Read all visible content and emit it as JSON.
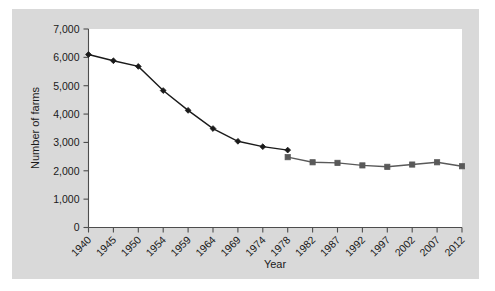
{
  "chart_data": {
    "type": "line",
    "title": "",
    "xlabel": "Year",
    "ylabel": "Number of farms",
    "x": [
      "1940",
      "1945",
      "1950",
      "1954",
      "1959",
      "1964",
      "1969",
      "1974",
      "1978",
      "1982",
      "1987",
      "1992",
      "1997",
      "2002",
      "2007",
      "2012"
    ],
    "xtick_labels": [
      "1940",
      "1945",
      "1950",
      "1954",
      "1959",
      "1964",
      "1969",
      "1974",
      "1978",
      "1982",
      "1987",
      "1992",
      "1997",
      "2002",
      "2007",
      "2012"
    ],
    "ytick_labels": [
      "0",
      "1,000",
      "2,000",
      "3,000",
      "4,000",
      "5,000",
      "6,000",
      "7,000"
    ],
    "ytick_values": [
      0,
      1000,
      2000,
      3000,
      4000,
      5000,
      6000,
      7000
    ],
    "ylim": [
      0,
      7000
    ],
    "grid": false,
    "legend": "none",
    "series": [
      {
        "name": "Number of farms (1940-1978)",
        "marker": "diamond",
        "color": "#1a1a1a",
        "points": [
          {
            "x": "1940",
            "y": 6100
          },
          {
            "x": "1945",
            "y": 5880
          },
          {
            "x": "1950",
            "y": 5680
          },
          {
            "x": "1954",
            "y": 4830
          },
          {
            "x": "1959",
            "y": 4130
          },
          {
            "x": "1964",
            "y": 3490
          },
          {
            "x": "1969",
            "y": 3040
          },
          {
            "x": "1974",
            "y": 2850
          },
          {
            "x": "1978",
            "y": 2730
          }
        ]
      },
      {
        "name": "Number of farms (1978-2012)",
        "marker": "square",
        "color": "#595959",
        "points": [
          {
            "x": "1978",
            "y": 2480
          },
          {
            "x": "1982",
            "y": 2300
          },
          {
            "x": "1987",
            "y": 2280
          },
          {
            "x": "1992",
            "y": 2190
          },
          {
            "x": "1997",
            "y": 2140
          },
          {
            "x": "2002",
            "y": 2220
          },
          {
            "x": "2007",
            "y": 2300
          },
          {
            "x": "2012",
            "y": 2160
          }
        ]
      }
    ]
  },
  "figure": {
    "panel_color": "#d9d9d9",
    "plot_color": "#ffffff",
    "axis_color": "#4d4d4d"
  }
}
